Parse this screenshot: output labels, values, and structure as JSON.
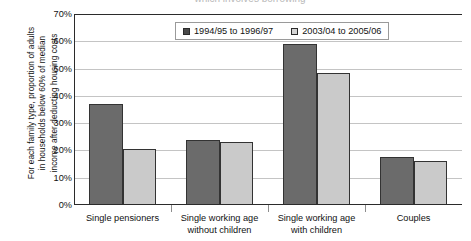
{
  "title": "which involves borrowing",
  "axis": {
    "ylabel_lines": [
      "For each family type, proportion of adults",
      "in households below 60% of median",
      "income after deducting housing costs"
    ],
    "yticks": [
      "0%",
      "10%",
      "20%",
      "30%",
      "40%",
      "50%",
      "60%",
      "70%"
    ]
  },
  "legend": {
    "items": [
      {
        "label": "1994/95 to 1996/97",
        "color": "#4a4a4a"
      },
      {
        "label": "2003/04 to 2005/06",
        "color": "#d4d4d4"
      }
    ]
  },
  "chart_data": {
    "type": "bar",
    "title": "",
    "xlabel": "",
    "ylabel": "For each family type, proportion of adults in households below 60% of median income after deducting housing costs",
    "ylim": [
      0,
      70
    ],
    "ytick_values": [
      0,
      10,
      20,
      30,
      40,
      50,
      60,
      70
    ],
    "grid": true,
    "legend_position": "top-center-inside",
    "categories": [
      "Single pensioners",
      "Single working age without children",
      "Single working age with children",
      "Couples"
    ],
    "category_lines": [
      [
        "Single pensioners"
      ],
      [
        "Single working age",
        "without children"
      ],
      [
        "Single working age",
        "with children"
      ],
      [
        "Couples"
      ]
    ],
    "series": [
      {
        "name": "1994/95 to 1996/97",
        "color": "#6b6b6b",
        "values": [
          37,
          24,
          59,
          17.5
        ]
      },
      {
        "name": "2003/04 to 2005/06",
        "color": "#cacaca",
        "values": [
          20.5,
          23,
          48.5,
          16
        ]
      }
    ]
  }
}
